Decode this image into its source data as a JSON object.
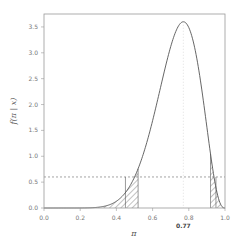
{
  "chart_data": {
    "type": "area",
    "title": "",
    "xlabel": "π",
    "ylabel": "f(π | x)",
    "xlim": [
      0.0,
      1.0
    ],
    "ylim": [
      0.0,
      3.75
    ],
    "x_ticks": [
      "0.0",
      "0.2",
      "0.4",
      "0.6",
      "0.8",
      "1.0"
    ],
    "y_ticks": [
      "0.0",
      "0.5",
      "1.0",
      "1.5",
      "2.0",
      "2.5",
      "3.0",
      "3.5"
    ],
    "mode": 0.77,
    "mode_label": "0.77",
    "hpd_density_level": 0.6,
    "curve": {
      "description": "Beta-like posterior density",
      "x": [
        0.0,
        0.3,
        0.4,
        0.5,
        0.52,
        0.6,
        0.7,
        0.77,
        0.85,
        0.92,
        0.95,
        1.0
      ],
      "y": [
        0.0,
        0.05,
        0.2,
        0.55,
        0.6,
        1.4,
        2.8,
        3.6,
        2.6,
        0.6,
        0.25,
        0.0
      ]
    },
    "shaded_tails": [
      {
        "from": 0.3,
        "to": 0.52,
        "label": "left tail"
      },
      {
        "from": 0.92,
        "to": 1.0,
        "label": "right tail"
      }
    ],
    "tail_markers": [
      0.45,
      0.52,
      0.92,
      0.95
    ],
    "annotations": [
      {
        "type": "hline",
        "y": 0.6,
        "style": "dashed"
      },
      {
        "type": "vline",
        "x": 0.77,
        "style": "dotted"
      }
    ],
    "grid": false,
    "legend": "none"
  }
}
